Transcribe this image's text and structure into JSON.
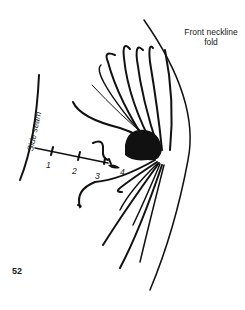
{
  "diagram": {
    "title_line1": "Front neckline",
    "title_line2": "fold",
    "side_label": "Side seam",
    "markers": [
      "1",
      "2",
      "3",
      "4"
    ],
    "figure_number": "52",
    "ink_color": "#111111"
  }
}
